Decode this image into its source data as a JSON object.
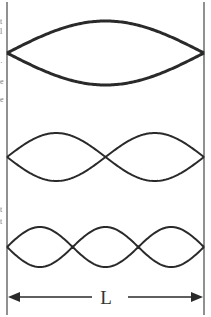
{
  "diagram": {
    "length_label": "L",
    "colors": {
      "stroke": "#2a2a2a",
      "boundary": "#555555",
      "background": "#ffffff"
    },
    "boundaries": {
      "left_x": 7,
      "right_x": 204,
      "top_y": 2,
      "bottom_y": 315
    },
    "modes": [
      {
        "name": "fundamental",
        "harmonic": 1,
        "loops": 1,
        "center_y": 53,
        "amplitude": 32,
        "stroke_width": 3
      },
      {
        "name": "second-harmonic",
        "harmonic": 2,
        "loops": 2,
        "center_y": 157,
        "amplitude": 24,
        "stroke_width": 2
      },
      {
        "name": "third-harmonic",
        "harmonic": 3,
        "loops": 3,
        "center_y": 247,
        "amplitude": 20,
        "stroke_width": 2
      }
    ],
    "dimension_arrow": {
      "y": 297,
      "label_x": 106,
      "gap_left": 92,
      "gap_right": 128
    },
    "edge_fragments": [
      {
        "y": 22,
        "text": "t"
      },
      {
        "y": 32,
        "text": "l"
      },
      {
        "y": 63,
        "text": "·"
      },
      {
        "y": 82,
        "text": "e"
      },
      {
        "y": 100,
        "text": "e"
      },
      {
        "y": 210,
        "text": "t"
      },
      {
        "y": 222,
        "text": "t"
      }
    ]
  }
}
